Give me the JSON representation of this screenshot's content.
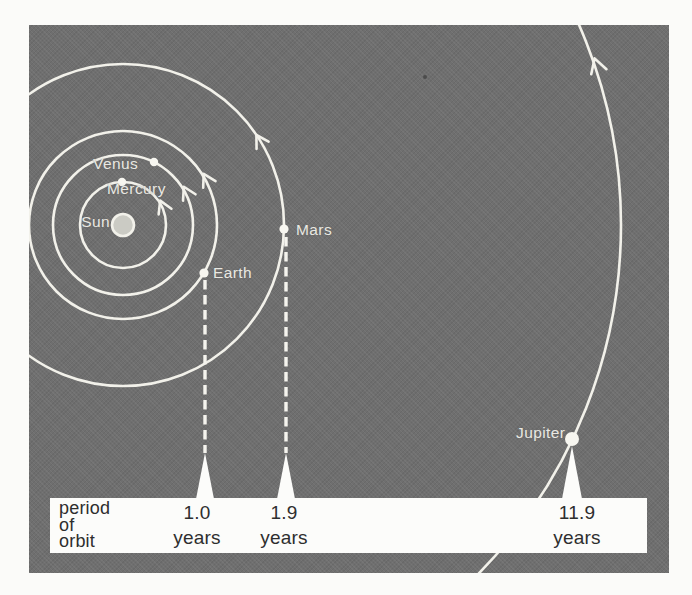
{
  "diagram": {
    "title": "planetary orbits with periods",
    "colors": {
      "figure_background": "#6f6f6f",
      "orbit_line": "#f2f1ea",
      "panel_background": "#fcfcfa",
      "panel_text": "#2e2e2e",
      "label_text": "#e9e8e2"
    },
    "labels": {
      "sun": "Sun",
      "mercury": "Mercury",
      "venus": "Venus",
      "earth": "Earth",
      "mars": "Mars",
      "jupiter": "Jupiter"
    },
    "icons": {
      "direction_arrow": "chevron arrowhead on orbit path indicating counterclockwise orbital motion"
    },
    "panel": {
      "heading_lines": [
        "period",
        "of",
        "orbit"
      ],
      "periods": [
        {
          "planet": "Earth",
          "value": "1.0",
          "unit": "years"
        },
        {
          "planet": "Mars",
          "value": "1.9",
          "unit": "years"
        },
        {
          "planet": "Jupiter",
          "value": "11.9",
          "unit": "years"
        }
      ]
    }
  }
}
